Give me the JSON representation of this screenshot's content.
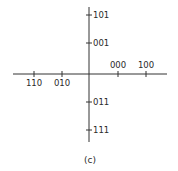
{
  "diagram": {
    "caption": "(c)",
    "line_color": "#333333",
    "horizontal_axis": {
      "ticks": [
        {
          "label": "110",
          "x": 34
        },
        {
          "label": "010",
          "x": 62
        },
        {
          "label": "000",
          "x": 118
        },
        {
          "label": "100",
          "x": 146
        }
      ]
    },
    "vertical_axis": {
      "ticks": [
        {
          "label": "101",
          "y": 15
        },
        {
          "label": "001",
          "y": 43
        },
        {
          "label": "011",
          "y": 102
        },
        {
          "label": "111",
          "y": 130
        }
      ]
    }
  }
}
